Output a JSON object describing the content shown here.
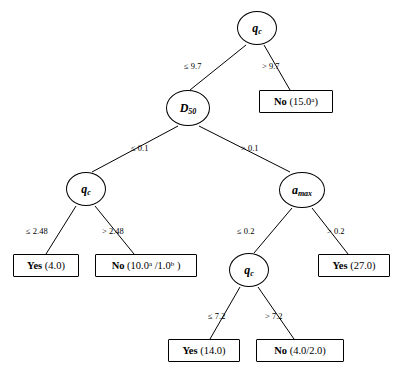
{
  "diagram": {
    "type": "decision-tree",
    "nodes": [
      {
        "id": "n0",
        "kind": "internal",
        "symbol": "q",
        "subscript": "c",
        "x": 237,
        "y": 11,
        "w": 40,
        "h": 34
      },
      {
        "id": "n1",
        "kind": "leaf",
        "label": "No",
        "value": "(15.0",
        "superscript": "a",
        "value_close": ")",
        "x": 259,
        "y": 90,
        "w": 74,
        "h": 23
      },
      {
        "id": "n2",
        "kind": "internal",
        "symbol": "D",
        "subscript": "50",
        "x": 166,
        "y": 90,
        "w": 44,
        "h": 36
      },
      {
        "id": "n3",
        "kind": "internal",
        "symbol": "q",
        "subscript": "c",
        "x": 66,
        "y": 172,
        "w": 40,
        "h": 34
      },
      {
        "id": "n4",
        "kind": "internal",
        "symbol": "a",
        "subscript": "max",
        "x": 279,
        "y": 172,
        "w": 46,
        "h": 36
      },
      {
        "id": "n5",
        "kind": "leaf",
        "label": "Yes",
        "value": "(4.0)",
        "x": 13,
        "y": 254,
        "w": 66,
        "h": 23
      },
      {
        "id": "n6",
        "kind": "leaf",
        "label": "No",
        "value_parts": "(10.0^a /1.0^b )",
        "x": 95,
        "y": 254,
        "w": 102,
        "h": 23
      },
      {
        "id": "n7",
        "kind": "internal",
        "symbol": "q",
        "subscript": "c",
        "x": 229,
        "y": 253,
        "w": 40,
        "h": 34
      },
      {
        "id": "n8",
        "kind": "leaf",
        "label": "Yes",
        "value": "(27.0)",
        "x": 318,
        "y": 254,
        "w": 72,
        "h": 23
      },
      {
        "id": "n9",
        "kind": "leaf",
        "label": "Yes",
        "value": "(14.0)",
        "x": 168,
        "y": 339,
        "w": 72,
        "h": 23
      },
      {
        "id": "n10",
        "kind": "leaf",
        "label": "No",
        "value": "(4.0/2.0)",
        "x": 256,
        "y": 339,
        "w": 88,
        "h": 23
      }
    ],
    "edges": [
      {
        "from": "n0",
        "to": "n2",
        "label": "≤ 9.7",
        "lx": 184,
        "ly": 61
      },
      {
        "from": "n0",
        "to": "n1",
        "label": "> 9.7",
        "lx": 262,
        "ly": 61
      },
      {
        "from": "n2",
        "to": "n3",
        "label": "≤ 0.1",
        "lx": 131,
        "ly": 143
      },
      {
        "from": "n2",
        "to": "n4",
        "label": "> 0.1",
        "lx": 241,
        "ly": 143
      },
      {
        "from": "n3",
        "to": "n5",
        "label": "≤ 2.48",
        "lx": 26,
        "ly": 226
      },
      {
        "from": "n3",
        "to": "n6",
        "label": "> 2.48",
        "lx": 102,
        "ly": 226
      },
      {
        "from": "n4",
        "to": "n7",
        "label": "≤ 0.2",
        "lx": 237,
        "ly": 226
      },
      {
        "from": "n4",
        "to": "n8",
        "label": "> 0.2",
        "lx": 327,
        "ly": 226
      },
      {
        "from": "n7",
        "to": "n9",
        "label": "≤ 7.2",
        "lx": 208,
        "ly": 311
      },
      {
        "from": "n7",
        "to": "n10",
        "label": "> 7.2",
        "lx": 265,
        "ly": 311
      }
    ],
    "labels": {
      "n0_text": "q_c",
      "n2_text": "D_50",
      "n4_text": "a_max",
      "leaf_no_15": "No (15.0ᵃ)",
      "leaf_yes_4": "Yes (4.0)",
      "leaf_no_10": "No (10.0ᵃ /1.0ᵇ)",
      "leaf_yes_27": "Yes (27.0)",
      "leaf_yes_14": "Yes (14.0)",
      "leaf_no_4_2": "No (4.0/2.0)"
    },
    "colors": {
      "stroke": "#000000",
      "background": "#ffffff",
      "text": "#000000"
    }
  }
}
